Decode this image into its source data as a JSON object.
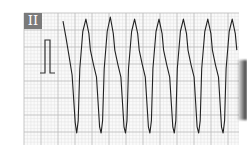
{
  "chart_data": {
    "type": "line",
    "title": "",
    "lead_label": "II",
    "xlabel": "",
    "ylabel": "",
    "grid": true,
    "grid_color_minor": "#e3e3e3",
    "grid_color_major": "#b9b9b9",
    "trace_color": "#222222",
    "calibration_mark": "1 mV",
    "xlim": [
      0,
      2.5
    ],
    "ylim": [
      -2.0,
      1.0
    ],
    "units": {
      "x": "s",
      "y": "mV"
    },
    "series": [
      {
        "name": "Lead II",
        "x": [
          0.0,
          0.04,
          0.08,
          0.12,
          0.16,
          0.18,
          0.2,
          0.22,
          0.26,
          0.3,
          0.34,
          0.36,
          0.4,
          0.44,
          0.48,
          0.5,
          0.52,
          0.54,
          0.58,
          0.62,
          0.66,
          0.68,
          0.72,
          0.76,
          0.8,
          0.82,
          0.84,
          0.86,
          0.9,
          0.94,
          0.98,
          1.0,
          1.04,
          1.08,
          1.12,
          1.14,
          1.16,
          1.18,
          1.22,
          1.26,
          1.3,
          1.32,
          1.36,
          1.4,
          1.44,
          1.46,
          1.48,
          1.5,
          1.54,
          1.58,
          1.62,
          1.64,
          1.68,
          1.72,
          1.76,
          1.78,
          1.8,
          1.82,
          1.86,
          1.9,
          1.94,
          1.96,
          2.0,
          2.04,
          2.08,
          2.1,
          2.12,
          2.14,
          2.18,
          2.22,
          2.26,
          2.28
        ],
        "y": [
          0.85,
          0.45,
          0.0,
          -0.45,
          -1.6,
          -1.85,
          -1.55,
          -0.3,
          0.6,
          0.9,
          0.55,
          0.15,
          -0.2,
          -0.5,
          -1.7,
          -1.85,
          -1.55,
          -0.3,
          0.6,
          0.95,
          0.55,
          0.15,
          -0.2,
          -0.5,
          -1.7,
          -1.85,
          -1.55,
          -0.3,
          0.6,
          0.9,
          0.55,
          0.15,
          -0.2,
          -0.5,
          -1.7,
          -1.85,
          -1.55,
          -0.3,
          0.6,
          0.9,
          0.55,
          0.15,
          -0.2,
          -0.5,
          -1.7,
          -1.85,
          -1.55,
          -0.3,
          0.6,
          0.9,
          0.55,
          0.15,
          -0.2,
          -0.5,
          -1.7,
          -1.85,
          -1.55,
          -0.3,
          0.6,
          0.9,
          0.55,
          0.15,
          -0.2,
          -0.5,
          -1.7,
          -1.85,
          -1.55,
          -0.3,
          0.6,
          0.9,
          0.55,
          0.15
        ]
      }
    ],
    "peaks_count": 5,
    "troughs_count": 5
  }
}
